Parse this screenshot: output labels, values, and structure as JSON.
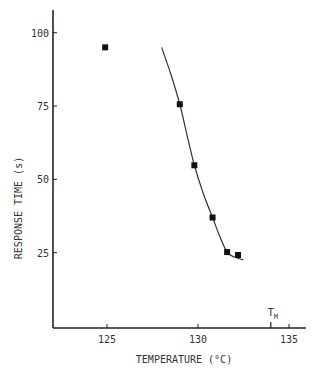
{
  "chart_data": {
    "type": "scatter",
    "title": "",
    "xlabel": "TEMPERATURE (°C)",
    "ylabel": "RESPONSE TIME (s)",
    "xlim": [
      122,
      136.3
    ],
    "ylim": [
      0,
      107
    ],
    "x_ticks": [
      125,
      130,
      135
    ],
    "y_ticks": [
      25,
      50,
      75,
      100
    ],
    "grid": false,
    "legend": null,
    "series": [
      {
        "name": "measured",
        "marker": "square",
        "points": [
          {
            "x": 124.9,
            "y": 95
          },
          {
            "x": 129.0,
            "y": 75.6
          },
          {
            "x": 129.8,
            "y": 54.8
          },
          {
            "x": 130.8,
            "y": 37
          },
          {
            "x": 131.6,
            "y": 25.2
          },
          {
            "x": 132.2,
            "y": 24.2
          }
        ]
      },
      {
        "name": "fitted curve",
        "type": "line",
        "points": [
          {
            "x": 128.0,
            "y": 95
          },
          {
            "x": 128.5,
            "y": 86
          },
          {
            "x": 129.0,
            "y": 75.6
          },
          {
            "x": 129.4,
            "y": 65
          },
          {
            "x": 129.8,
            "y": 54.8
          },
          {
            "x": 130.3,
            "y": 45
          },
          {
            "x": 130.8,
            "y": 37
          },
          {
            "x": 131.2,
            "y": 30.5
          },
          {
            "x": 131.6,
            "y": 25.2
          },
          {
            "x": 132.0,
            "y": 23.5
          },
          {
            "x": 132.5,
            "y": 22.5
          }
        ]
      }
    ],
    "annotations": [
      {
        "text": "T",
        "subscript": "M",
        "x": 134.0,
        "note": "tick mark on x-axis"
      }
    ]
  }
}
